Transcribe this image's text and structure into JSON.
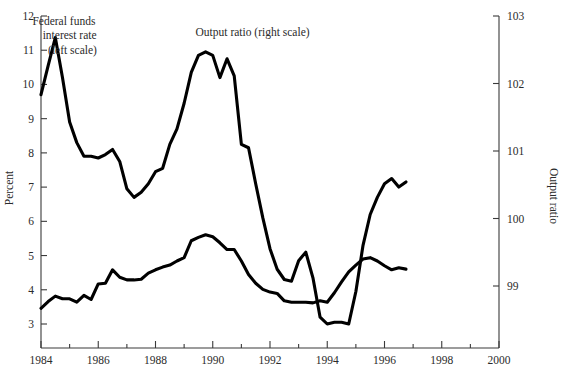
{
  "chart_data": {
    "type": "line",
    "title": "",
    "xlabel": "",
    "ylabel": "Percent",
    "y2label": "Output ratio",
    "xlim": [
      1984,
      2000
    ],
    "ylim": [
      2.3,
      12
    ],
    "y2lim": [
      98.28,
      103
    ],
    "grid": false,
    "legend_position": "in-plot-annotations",
    "x_ticks": [
      1984,
      1986,
      1988,
      1990,
      1992,
      1994,
      1996,
      1998,
      2000
    ],
    "x_minor_ticks": [
      1985,
      1987,
      1989,
      1991,
      1993,
      1995,
      1997,
      1999
    ],
    "y_ticks": [
      3,
      4,
      5,
      6,
      7,
      8,
      9,
      10,
      11,
      12
    ],
    "y2_ticks": [
      99,
      100,
      101,
      102,
      103
    ],
    "annotations": [
      {
        "text": "Federal funds",
        "x": 1984.8,
        "y": 11.75
      },
      {
        "text": "interest rate",
        "x": 1985.0,
        "y": 11.32
      },
      {
        "text": "(left scale)",
        "x": 1985.1,
        "y": 10.9
      },
      {
        "text": "Output ratio (right scale)",
        "x": 1989.4,
        "y": 11.42
      }
    ],
    "series": [
      {
        "name": "Federal funds interest rate (left scale)",
        "axis": "left",
        "color": "#000000",
        "x": [
          1984.0,
          1984.25,
          1984.5,
          1984.75,
          1985.0,
          1985.25,
          1985.5,
          1985.75,
          1986.0,
          1986.25,
          1986.5,
          1986.75,
          1987.0,
          1987.25,
          1987.5,
          1987.75,
          1988.0,
          1988.25,
          1988.5,
          1988.75,
          1989.0,
          1989.25,
          1989.5,
          1989.75,
          1990.0,
          1990.25,
          1990.5,
          1990.75,
          1991.0,
          1991.25,
          1991.5,
          1991.75,
          1992.0,
          1992.25,
          1992.5,
          1992.75,
          1993.0,
          1993.25,
          1993.5,
          1993.75,
          1994.0,
          1994.25,
          1994.5,
          1994.75,
          1995.0,
          1995.25,
          1995.5,
          1995.75,
          1996.0,
          1996.25,
          1996.5,
          1996.75
        ],
        "y": [
          9.7,
          10.55,
          11.37,
          10.2,
          8.9,
          8.3,
          7.9,
          7.9,
          7.85,
          7.95,
          8.1,
          7.75,
          6.95,
          6.7,
          6.85,
          7.1,
          7.45,
          7.55,
          8.25,
          8.7,
          9.45,
          10.35,
          10.85,
          10.95,
          10.85,
          10.2,
          10.75,
          10.25,
          8.25,
          8.15,
          7.1,
          6.1,
          5.2,
          4.6,
          4.3,
          4.25,
          4.85,
          5.1,
          4.35,
          3.2,
          3.0,
          3.05,
          3.05,
          3.0,
          3.95,
          5.3,
          6.2,
          6.7,
          7.1,
          7.25,
          7.0,
          7.15
        ],
        "description": "Quarterly US federal funds rate, percent, 1984:Q1-1996:Q4"
      },
      {
        "name": "Output ratio (right scale)",
        "axis": "right",
        "color": "#000000",
        "x": [
          1984.0,
          1984.25,
          1984.5,
          1984.75,
          1985.0,
          1985.25,
          1985.5,
          1985.75,
          1986.0,
          1986.25,
          1986.5,
          1986.75,
          1987.0,
          1987.25,
          1987.5,
          1987.75,
          1988.0,
          1988.25,
          1988.5,
          1988.75,
          1989.0,
          1989.25,
          1989.5,
          1989.75,
          1990.0,
          1990.25,
          1990.5,
          1990.75,
          1991.0,
          1991.25,
          1991.5,
          1991.75,
          1992.0,
          1992.25,
          1992.5,
          1992.75,
          1993.0,
          1993.25,
          1993.5,
          1993.75,
          1994.0,
          1994.25,
          1994.5,
          1994.75,
          1995.0,
          1995.25,
          1995.5,
          1995.75,
          1996.0,
          1996.25,
          1996.5,
          1996.75
        ],
        "y_percent_equiv": [
          2.3,
          3.0,
          3.55,
          3.3,
          3.25,
          2.95,
          3.65,
          3.2,
          4.8,
          4.85,
          6.2,
          5.45,
          5.2,
          5.2,
          5.3,
          5.9,
          6.25,
          6.5,
          6.7,
          7.1,
          7.45,
          9.1,
          9.45,
          9.75,
          9.5,
          8.9,
          8.25,
          8.2,
          7.05,
          5.7,
          4.85,
          4.2,
          3.95,
          3.8,
          3.05,
          2.95,
          2.95,
          2.95,
          2.9,
          3.05,
          2.95,
          3.85,
          4.95,
          5.95,
          6.6,
          7.25,
          7.35,
          7.0,
          6.55,
          6.1,
          6.3,
          6.2
        ],
        "y": [
          98.67,
          98.77,
          98.85,
          98.81,
          98.81,
          98.76,
          98.86,
          98.8,
          99.03,
          99.04,
          99.24,
          99.13,
          99.09,
          99.09,
          99.1,
          99.19,
          99.24,
          99.28,
          99.31,
          99.37,
          99.42,
          99.67,
          99.72,
          99.76,
          99.73,
          99.64,
          99.54,
          99.54,
          99.37,
          99.17,
          99.04,
          98.95,
          98.91,
          98.89,
          98.78,
          98.76,
          98.76,
          98.76,
          98.75,
          98.78,
          98.76,
          98.9,
          99.06,
          99.21,
          99.31,
          99.4,
          99.42,
          99.37,
          99.3,
          99.24,
          99.27,
          99.25
        ],
        "description": "Quarterly output ratio (actual/potential output index), 1984:Q1-1996:Q4"
      }
    ]
  },
  "axes": {
    "left": {
      "label": "Percent",
      "tick_labels": [
        "12",
        "11",
        "10",
        "9",
        "8",
        "7",
        "6",
        "5",
        "4",
        "3"
      ]
    },
    "right": {
      "label": "Output ratio",
      "tick_labels": [
        "103",
        "102",
        "101",
        "100",
        "99"
      ]
    },
    "bottom": {
      "tick_labels": [
        "1984",
        "1986",
        "1988",
        "1990",
        "1992",
        "1994",
        "1996",
        "1998",
        "2000"
      ]
    }
  },
  "annotations": {
    "fed_funds_line1": "Federal funds",
    "fed_funds_line2": "interest rate",
    "fed_funds_line3": "(left scale)",
    "output_ratio": "Output ratio (right scale)"
  },
  "colors": {
    "line": "#000000",
    "axis": "#3a3a3a",
    "text": "#2b2b2b",
    "background": "#ffffff"
  }
}
